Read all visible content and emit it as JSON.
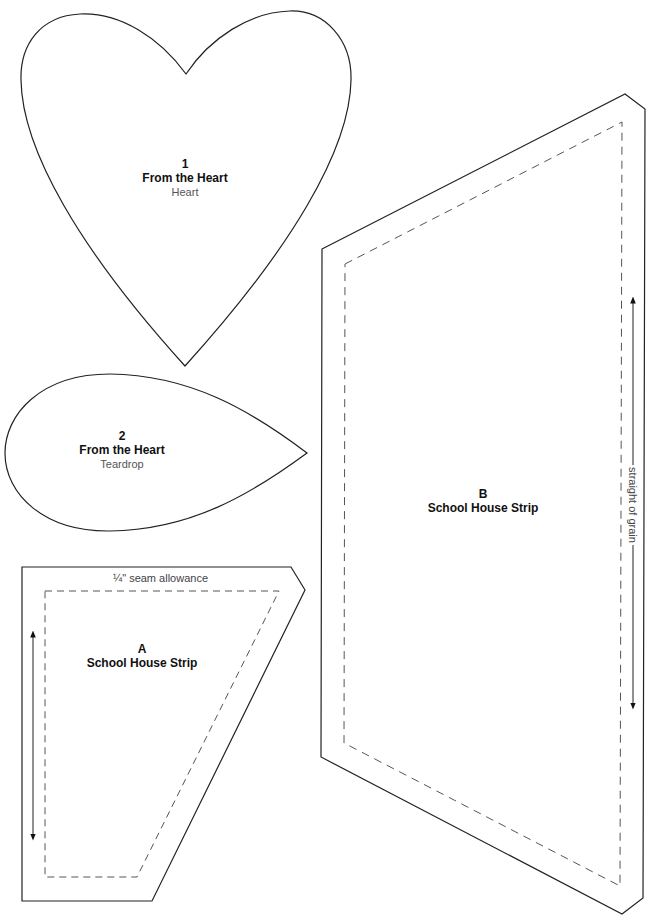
{
  "pieces": {
    "heart": {
      "number": "1",
      "title": "From the Heart",
      "subtitle": "Heart"
    },
    "teardrop": {
      "number": "2",
      "title": "From the Heart",
      "subtitle": "Teardrop"
    },
    "piece_a": {
      "letter": "A",
      "title": "School House Strip",
      "seam_label": "¼\" seam allowance"
    },
    "piece_b": {
      "letter": "B",
      "title": "School House Strip",
      "grain_label": "straight of grain"
    }
  },
  "colors": {
    "outline": "#222222",
    "dashed": "#555555",
    "label_sub": "#555555"
  }
}
